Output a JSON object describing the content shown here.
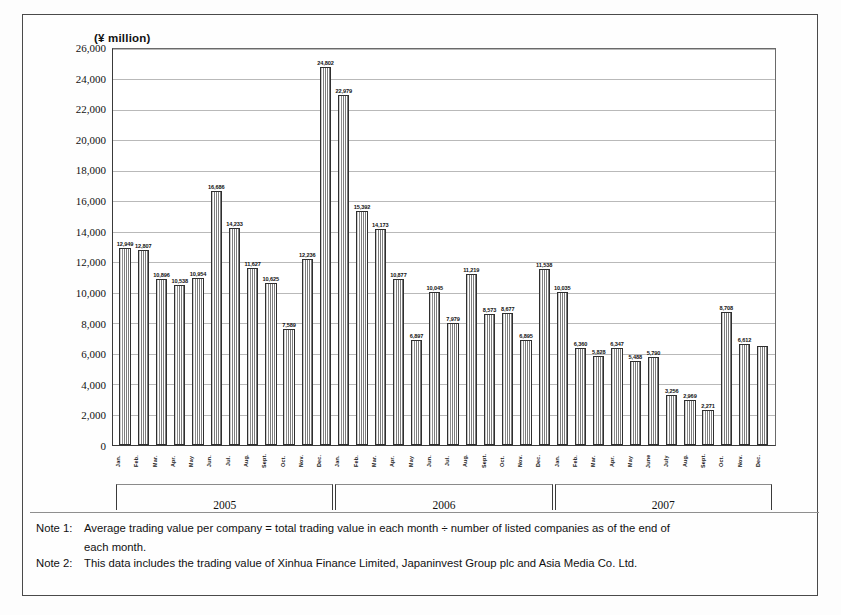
{
  "figure": {
    "axis_unit_label": "(¥ million)"
  },
  "chart_data": {
    "type": "bar",
    "title": "",
    "subtitle": "",
    "xlabel": "",
    "ylabel": "(¥ million)",
    "ylim": [
      0,
      26000
    ],
    "ytick_step": 2000,
    "grid": true,
    "legend": "none",
    "yticks": [
      "26,000",
      "24,000",
      "22,000",
      "20,000",
      "18,000",
      "16,000",
      "14,000",
      "12,000",
      "10,000",
      "8,000",
      "6,000",
      "4,000",
      "2,000",
      "0"
    ],
    "ytick_values": [
      26000,
      24000,
      22000,
      20000,
      18000,
      16000,
      14000,
      12000,
      10000,
      8000,
      6000,
      4000,
      2000,
      0
    ],
    "year_groups": [
      {
        "label": "2005",
        "count": 12
      },
      {
        "label": "2006",
        "count": 12
      },
      {
        "label": "2007",
        "count": 12
      }
    ],
    "categories": [
      "Jan.",
      "Feb.",
      "Mar.",
      "Apr.",
      "May",
      "Jun.",
      "Jul.",
      "Aug.",
      "Sept.",
      "Oct.",
      "Nov.",
      "Dec.",
      "Jan.",
      "Feb.",
      "Mar.",
      "Apr.",
      "May",
      "Jun.",
      "Jul.",
      "Aug.",
      "Sept.",
      "Oct.",
      "Nov.",
      "Dec.",
      "Jan.",
      "Feb.",
      "Mar.",
      "Apr.",
      "May",
      "June",
      "July",
      "Aug.",
      "Sept.",
      "Oct.",
      "Nov.",
      "Dec."
    ],
    "values": [
      12949,
      12807,
      10896,
      10538,
      10954,
      16686,
      14233,
      11627,
      10625,
      7589,
      12236,
      24802,
      22979,
      15392,
      14173,
      10877,
      6897,
      10045,
      7979,
      11219,
      8573,
      8677,
      6895,
      11538,
      10035,
      6360,
      5828,
      6347,
      5488,
      5790,
      3256,
      2969,
      2271,
      8708,
      6612,
      6500
    ],
    "labels": [
      "12,949",
      "12,807",
      "10,896",
      "10,538",
      "10,954",
      "16,686",
      "14,233",
      "11,627",
      "10,625",
      "7,589",
      "12,236",
      "24,802",
      "22,979",
      "15,392",
      "14,173",
      "10,877",
      "6,897",
      "10,045",
      "7,979",
      "11,219",
      "8,573",
      "8,677",
      "6,895",
      "11,538",
      "10,035",
      "6,360",
      "5,828",
      "6,347",
      "5,488",
      "5,790",
      "3,256",
      "2,969",
      "2,271",
      "8,708",
      "6,612",
      ""
    ]
  },
  "notes": [
    {
      "tag": "Note 1:",
      "text": "Average trading value per company  =  total trading value in each month ÷ number of listed companies as of the end of",
      "continuation": "each month."
    },
    {
      "tag": "Note 2:",
      "text": "This data includes the trading value of Xinhua Finance Limited, Japaninvest Group plc and Asia Media Co. Ltd.",
      "continuation": ""
    }
  ]
}
